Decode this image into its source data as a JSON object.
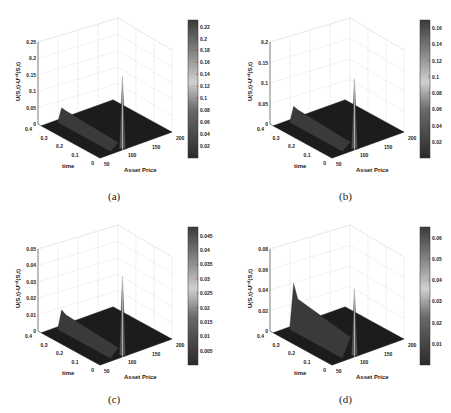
{
  "figure": {
    "panels": [
      {
        "id": "a",
        "caption": "(a)"
      },
      {
        "id": "b",
        "caption": "(b)"
      },
      {
        "id": "c",
        "caption": "(c)"
      },
      {
        "id": "d",
        "caption": "(d)"
      }
    ]
  },
  "chart_data": [
    {
      "type": "surface",
      "panel": "(a)",
      "xlabel": "Asset Price",
      "ylabel": "time",
      "zlabel": "U(S,t)-U^ref(S,t)",
      "x_ticks": [
        "50",
        "100",
        "150",
        "200"
      ],
      "y_ticks": [
        "0",
        "0.1",
        "0.2",
        "0.3",
        "0.4"
      ],
      "z_ticks": [
        "0",
        "0.05",
        "0.1",
        "0.15",
        "0.2",
        "0.25"
      ],
      "zlim": [
        0,
        0.25
      ],
      "colorbar_ticks": [
        "0.02",
        "0.04",
        "0.06",
        "0.08",
        "0.1",
        "0.12",
        "0.14",
        "0.16",
        "0.18",
        "0.2",
        "0.22"
      ],
      "peak": {
        "asset_price": 100,
        "time": 0,
        "value": 0.22
      },
      "grid": true
    },
    {
      "type": "surface",
      "panel": "(b)",
      "xlabel": "Asset Price",
      "ylabel": "time",
      "zlabel": "U(S,t)-U^ref(S,t)",
      "x_ticks": [
        "50",
        "100",
        "150",
        "200"
      ],
      "y_ticks": [
        "0",
        "0.1",
        "0.2",
        "0.3",
        "0.4"
      ],
      "z_ticks": [
        "0",
        "0.05",
        "0.1",
        "0.15",
        "0.2"
      ],
      "zlim": [
        0,
        0.2
      ],
      "colorbar_ticks": [
        "0.02",
        "0.04",
        "0.06",
        "0.08",
        "0.1",
        "0.12",
        "0.14",
        "0.16"
      ],
      "peak": {
        "asset_price": 100,
        "time": 0,
        "value": 0.17
      },
      "grid": true
    },
    {
      "type": "surface",
      "panel": "(c)",
      "xlabel": "Asset Price",
      "ylabel": "time",
      "zlabel": "U(S,t)-U^ref(S,t)",
      "x_ticks": [
        "50",
        "100",
        "150",
        "200"
      ],
      "y_ticks": [
        "0",
        "0.1",
        "0.2",
        "0.3",
        "0.4"
      ],
      "z_ticks": [
        "0",
        "0.01",
        "0.02",
        "0.03",
        "0.04",
        "0.05"
      ],
      "zlim": [
        0,
        0.05
      ],
      "colorbar_ticks": [
        "0.005",
        "0.01",
        "0.015",
        "0.02",
        "0.025",
        "0.03",
        "0.035",
        "0.04",
        "0.045"
      ],
      "peak": {
        "asset_price": 100,
        "time": 0,
        "value": 0.048
      },
      "grid": true
    },
    {
      "type": "surface",
      "panel": "(d)",
      "xlabel": "Asset Price",
      "ylabel": "time",
      "zlabel": "U(S,t)-U^ref(S,t)",
      "x_ticks": [
        "50",
        "100",
        "150",
        "200"
      ],
      "y_ticks": [
        "0",
        "0.1",
        "0.2",
        "0.3",
        "0.4"
      ],
      "z_ticks": [
        "0",
        "0.02",
        "0.04",
        "0.06",
        "0.08"
      ],
      "zlim": [
        0,
        0.08
      ],
      "colorbar_ticks": [
        "0.01",
        "0.02",
        "0.03",
        "0.04",
        "0.05",
        "0.06"
      ],
      "peak": {
        "asset_price": 100,
        "time": 0,
        "value": 0.065
      },
      "grid": true
    }
  ]
}
